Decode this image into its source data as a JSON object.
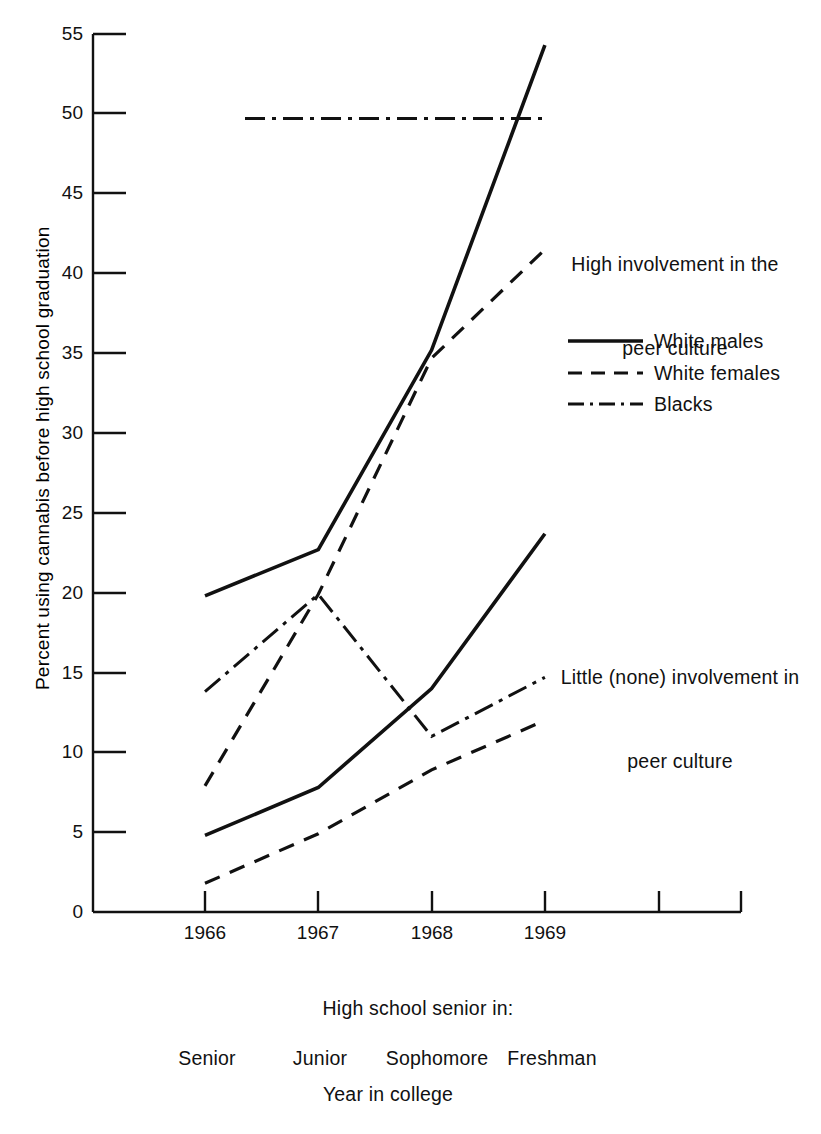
{
  "chart_data": {
    "type": "line",
    "title": "",
    "xlabel": "High school senior in:",
    "ylabel": "Percent using cannabis before high school graduation",
    "x": [
      "1966",
      "1967",
      "1968",
      "1969"
    ],
    "xtick_labels": [
      "1966",
      "1967",
      "1968",
      "1969",
      "",
      ""
    ],
    "ytick_labels": [
      "0",
      "5",
      "10",
      "15",
      "20",
      "25",
      "30",
      "35",
      "40",
      "45",
      "50",
      "55"
    ],
    "ylim": [
      0,
      55
    ],
    "ytick_step": 5,
    "grid": false,
    "legend_position": "right",
    "groups": [
      {
        "name": "High involvement in the peer culture",
        "annotation": "High involvement in the\npeer culture",
        "series": [
          {
            "name": "White males",
            "style": "solid",
            "values": [
              19.8,
              22.7,
              35.2,
              54.3
            ]
          },
          {
            "name": "White females",
            "style": "dashed",
            "values": [
              7.9,
              19.9,
              34.7,
              41.5
            ]
          },
          {
            "name": "Blacks",
            "style": "dash-dot",
            "values": [
              49.7,
              49.7,
              49.7,
              49.7
            ]
          }
        ]
      },
      {
        "name": "Little (none) involvement in peer culture",
        "annotation": "Little (none) involvement in\npeer culture",
        "series": [
          {
            "name": "White males",
            "style": "solid",
            "values": [
              4.8,
              7.8,
              14.0,
              23.7
            ]
          },
          {
            "name": "White females",
            "style": "dashed",
            "values": [
              1.8,
              4.9,
              8.9,
              12.0
            ]
          },
          {
            "name": "Blacks",
            "style": "dash-dot",
            "values": [
              13.8,
              19.9,
              11.0,
              14.7
            ]
          }
        ]
      }
    ],
    "legend": [
      {
        "label": "White males",
        "style": "solid"
      },
      {
        "label": "White females",
        "style": "dashed"
      },
      {
        "label": "Blacks",
        "style": "dash-dot"
      }
    ],
    "annotations": {
      "high_group": "High involvement in the",
      "high_group_2": "peer culture",
      "low_group": "Little (none) involvement in",
      "low_group_2": "peer culture"
    },
    "captions": {
      "high_school_senior": "High school senior in:",
      "college_years": [
        "Senior",
        "Junior",
        "Sophomore",
        "Freshman"
      ],
      "year_in_college": "Year in college"
    },
    "colors": {
      "ink": "#111111",
      "background": "#ffffff"
    }
  },
  "axis": {
    "y_title": "Percent using cannabis before high school graduation",
    "y_ticks": [
      "55",
      "50",
      "45",
      "40",
      "35",
      "30",
      "25",
      "20",
      "15",
      "10",
      "5",
      "0"
    ],
    "x_ticks": [
      "1966",
      "1967",
      "1968",
      "1969"
    ]
  }
}
